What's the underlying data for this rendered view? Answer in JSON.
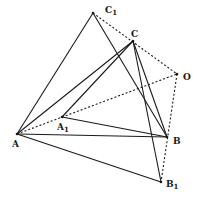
{
  "figure": {
    "points": {
      "A": {
        "label": "A",
        "sub": "",
        "x": 17,
        "y": 134,
        "lx": 12,
        "ly": 147
      },
      "A1": {
        "label": "A",
        "sub": "1",
        "x": 62,
        "y": 117,
        "lx": 58,
        "ly": 130
      },
      "B": {
        "label": "B",
        "sub": "",
        "x": 167,
        "y": 137,
        "lx": 173,
        "ly": 144
      },
      "B1": {
        "label": "B",
        "sub": "1",
        "x": 161,
        "y": 182,
        "lx": 167,
        "ly": 187
      },
      "C": {
        "label": "C",
        "sub": "",
        "x": 133,
        "y": 41,
        "lx": 132,
        "ly": 37
      },
      "C1": {
        "label": "C",
        "sub": "1",
        "x": 93,
        "y": 13,
        "lx": 106,
        "ly": 13
      },
      "O": {
        "label": "O",
        "sub": "",
        "x": 177,
        "y": 74,
        "lx": 183,
        "ly": 80
      }
    },
    "solid_segments": [
      [
        "A",
        "C1"
      ],
      [
        "A",
        "C"
      ],
      [
        "A",
        "B"
      ],
      [
        "A",
        "B1"
      ],
      [
        "A1",
        "C"
      ],
      [
        "A1",
        "B"
      ],
      [
        "C",
        "B"
      ],
      [
        "C1",
        "B"
      ],
      [
        "C",
        "B1"
      ]
    ],
    "dotted_segments": [
      [
        "C1",
        "O"
      ],
      [
        "A",
        "O"
      ],
      [
        "O",
        "B1"
      ]
    ],
    "labels": {
      "A": "A",
      "A1_main": "A",
      "A1_sub": "1",
      "B": "B",
      "B1_main": "B",
      "B1_sub": "1",
      "C": "C",
      "C1_main": "C",
      "C1_sub": "1",
      "O": "O"
    }
  }
}
